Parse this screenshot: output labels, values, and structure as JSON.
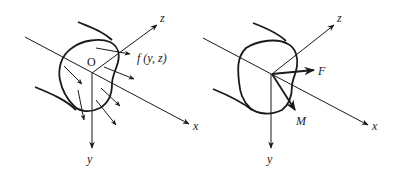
{
  "figure": {
    "left_panel": {
      "description": "Cross-section with distributed force f(y,z)",
      "origin_label": "O",
      "axis_labels": {
        "x": "x",
        "y": "y",
        "z": "z"
      },
      "force_label": "f (y, z)"
    },
    "right_panel": {
      "description": "Cross-section with resultant force F and moment M",
      "axis_labels": {
        "x": "x",
        "y": "y",
        "z": "z"
      },
      "force_label": "F",
      "moment_label": "M"
    },
    "colors": {
      "ink": "#1a1a1a",
      "background": "#ffffff"
    }
  }
}
